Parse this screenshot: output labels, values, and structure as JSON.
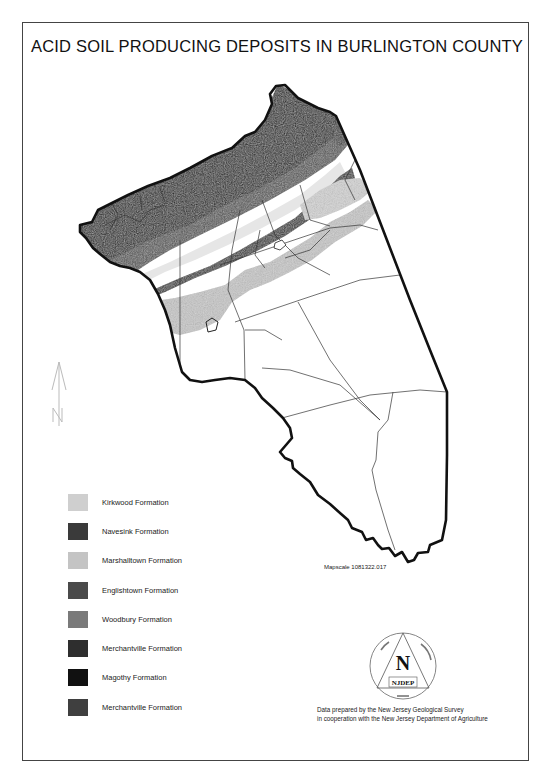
{
  "map": {
    "title": "ACID SOIL PRODUCING DEPOSITS IN BURLINGTON COUNTY",
    "mapscale_label": "Mapscale 1081322.017",
    "credit": {
      "line1": "Data prepared by the New Jersey Geological Survey",
      "line2": "in cooperation with the New Jersey Department of Agriculture"
    },
    "north_arrow": {
      "icon": "north-arrow-icon",
      "label": "N"
    },
    "logo": {
      "letter": "N",
      "agency": "NJDEP"
    }
  },
  "legend": {
    "items": [
      {
        "label": "Kirkwood Formation",
        "color": "#cfcfcf"
      },
      {
        "label": "Navesink Formation",
        "color": "#3a3a3a"
      },
      {
        "label": "Marshalltown Formation",
        "color": "#c4c4c4"
      },
      {
        "label": "Englishtown Formation",
        "color": "#4a4a4a"
      },
      {
        "label": "Woodbury Formation",
        "color": "#7a7a7a"
      },
      {
        "label": "Merchantville Formation",
        "color": "#2e2e2e"
      },
      {
        "label": "Magothy Formation",
        "color": "#111111"
      },
      {
        "label": "Merchantville Formation",
        "color": "#3f3f3f"
      }
    ]
  },
  "colors": {
    "border": "#111111",
    "municipal_lines": "#333333",
    "light_deposit": "#c8c8c8",
    "dark_deposit": "#2a2a2a"
  }
}
